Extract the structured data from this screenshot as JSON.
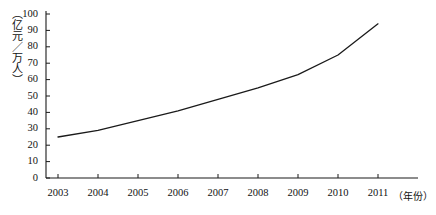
{
  "chart_data": {
    "type": "line",
    "title": "",
    "subtitle": "",
    "xlabel": "（年份）",
    "ylabel": "（亿元／万人）",
    "categories": [
      "2003",
      "2004",
      "2005",
      "2006",
      "2007",
      "2008",
      "2009",
      "2010",
      "2011"
    ],
    "series": [
      {
        "name": "",
        "values": [
          25,
          29,
          35,
          41,
          48,
          55,
          63,
          75,
          94
        ]
      }
    ],
    "ylim": [
      0,
      100
    ],
    "yticks": [
      0,
      10,
      20,
      30,
      40,
      50,
      60,
      70,
      80,
      90,
      100
    ],
    "ytick_labels": [
      "0",
      "10",
      "20",
      "30",
      "40",
      "50",
      "60",
      "70",
      "80",
      "90",
      "100"
    ],
    "xtick_labels": [
      "2003",
      "2004",
      "2005",
      "2006",
      "2007",
      "2008",
      "2009",
      "2010",
      "2011"
    ],
    "grid": false,
    "legend": "none",
    "line_color": "#1a1a1a",
    "axis_color": "#1a1a1a",
    "markers": false
  }
}
